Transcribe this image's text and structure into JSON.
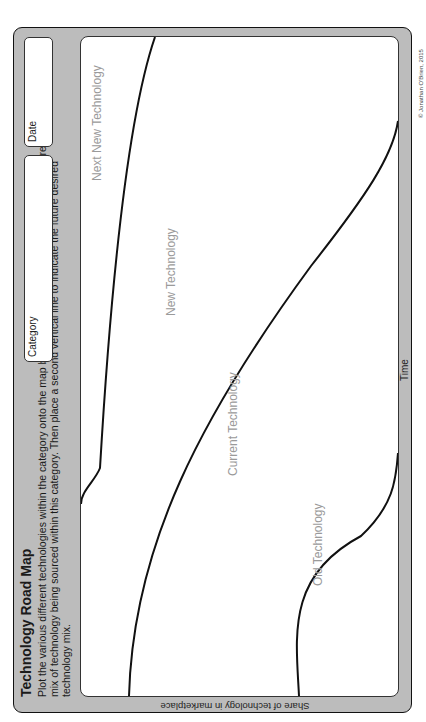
{
  "document": {
    "title": "Technology Road Map",
    "instructions": "Plot the various different technologies within the category onto the map below. Place a vertical line to indicate the current mix of technology being sourced within this category. Then place a second vertical line to indicate the future desired technology mix.",
    "fields": {
      "category_label": "Category",
      "category_value": "",
      "date_label": "Date",
      "date_value": ""
    },
    "axes": {
      "x_label": "Time",
      "y_label": "Share of technology in marketplace"
    },
    "regions": {
      "old": "Old Technology",
      "current": "Current Technology",
      "new": "New Technology",
      "next_new": "Next New Technology"
    },
    "copyright": "© Jonathan O'Brien, 2015"
  },
  "colors": {
    "frame_fill": "#bcbcbc",
    "plot_fill": "#ffffff",
    "curve_stroke": "#111111",
    "region_label": "#9a9a9a"
  }
}
